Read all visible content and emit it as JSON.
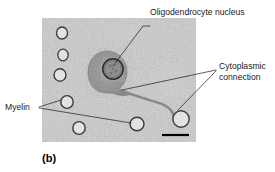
{
  "figure": {
    "panel_caption": "(b)",
    "kind": "electron-micrograph",
    "colors": {
      "micrograph_background": "#d9d9d9",
      "cell_body": "#9a9a9a",
      "nucleus_fill": "#8f8f8f",
      "nucleus_outline": "#2b2b2b",
      "myelin_outline": "#3a3a3a",
      "myelin_fill": "#dedede",
      "leader_line": "#1a1a1a",
      "scale_bar": "#000000",
      "label_text": "#1a1a1a",
      "page_background": "#ffffff"
    }
  },
  "labels": [
    {
      "id": "oligodendrocyte-nucleus",
      "text": "Oligodendrocyte nucleus"
    },
    {
      "id": "cytoplasmic-connection",
      "line1": "Cytoplasmic",
      "line2": "connection"
    },
    {
      "id": "myelin",
      "text": "Myelin"
    }
  ],
  "micrograph": {
    "frame": {
      "x": 42,
      "y": 18,
      "width": 154,
      "height": 124
    },
    "cell_body": {
      "cx": 107,
      "cy": 72,
      "rx": 19,
      "ry": 21
    },
    "nucleus": {
      "cx": 113,
      "cy": 69,
      "r": 10.5
    },
    "myelin_rings": [
      {
        "cx": 62,
        "cy": 33,
        "rx": 5.5,
        "ry": 6.0
      },
      {
        "cx": 63,
        "cy": 55,
        "rx": 5.2,
        "ry": 5.8
      },
      {
        "cx": 60,
        "cy": 75,
        "rx": 6.0,
        "ry": 6.2
      },
      {
        "cx": 67,
        "cy": 102,
        "rx": 6.2,
        "ry": 6.4
      },
      {
        "cx": 79,
        "cy": 128,
        "rx": 6.2,
        "ry": 6.4
      },
      {
        "cx": 137,
        "cy": 124,
        "rx": 7.0,
        "ry": 6.8
      },
      {
        "cx": 181,
        "cy": 119,
        "rx": 8.2,
        "ry": 8.2
      }
    ],
    "scale_bar": {
      "x1": 162,
      "x2": 189,
      "y": 135
    }
  }
}
